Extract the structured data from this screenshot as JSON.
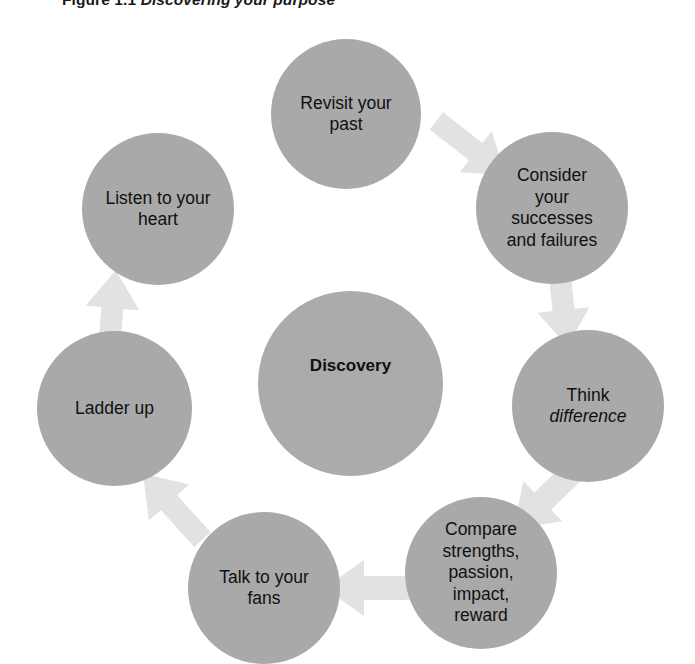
{
  "figure": {
    "caption_label": "Figure 1.1",
    "caption_title": "Discovering your purpose",
    "center": {
      "id": "discovery",
      "label": "Discovery"
    },
    "colors": {
      "node_fill": "#a9a9a9",
      "center_fill": "#ababab",
      "arrow_fill": "#e2e2e2",
      "text": "#101010",
      "background": "#ffffff"
    },
    "steps": [
      {
        "id": "revisit-your-past",
        "label": "Revisit your\npast",
        "position": "top"
      },
      {
        "id": "consider-successes-failures",
        "label": "Consider\nyour\nsuccesses\nand failures",
        "position": "top-right"
      },
      {
        "id": "think-difference",
        "label": "Think\ndifference",
        "position": "right",
        "italic_line": "difference"
      },
      {
        "id": "compare-strengths",
        "label": "Compare\nstrengths,\npassion,\nimpact,\nreward",
        "position": "bottom-right"
      },
      {
        "id": "talk-to-your-fans",
        "label": "Talk to your\nfans",
        "position": "bottom"
      },
      {
        "id": "ladder-up",
        "label": "Ladder up",
        "position": "bottom-left"
      },
      {
        "id": "listen-to-your-heart",
        "label": "Listen to your\nheart",
        "position": "top-left"
      }
    ],
    "arrows": [
      {
        "id": "arrow-revisit-to-consider",
        "from": "revisit-your-past",
        "to": "consider-successes-failures",
        "direction": "down-right"
      },
      {
        "id": "arrow-consider-to-think",
        "from": "consider-successes-failures",
        "to": "think-difference",
        "direction": "down"
      },
      {
        "id": "arrow-think-to-compare",
        "from": "think-difference",
        "to": "compare-strengths",
        "direction": "down-left"
      },
      {
        "id": "arrow-compare-to-talk",
        "from": "compare-strengths",
        "to": "talk-to-your-fans",
        "direction": "left"
      },
      {
        "id": "arrow-talk-to-ladder",
        "from": "talk-to-your-fans",
        "to": "ladder-up",
        "direction": "up-left"
      },
      {
        "id": "arrow-ladder-to-listen",
        "from": "ladder-up",
        "to": "listen-to-your-heart",
        "direction": "up"
      }
    ]
  }
}
